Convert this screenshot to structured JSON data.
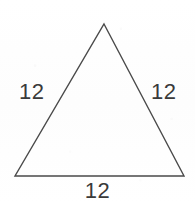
{
  "figure": {
    "type": "geometry-diagram",
    "shape_name": "triangle",
    "canvas": {
      "width": 195,
      "height": 205,
      "background_color": "#fefefe"
    },
    "stroke": {
      "color": "#4a4a4a",
      "width": 1.4
    },
    "text": {
      "color": "#3a3a3a",
      "font_size": 22
    },
    "vertices": {
      "apex": {
        "x": 104,
        "y": 24
      },
      "bottom_left": {
        "x": 15,
        "y": 176
      },
      "bottom_right": {
        "x": 184,
        "y": 176
      }
    },
    "labels": {
      "left_side": "12",
      "right_side": "12",
      "base": "12"
    }
  }
}
